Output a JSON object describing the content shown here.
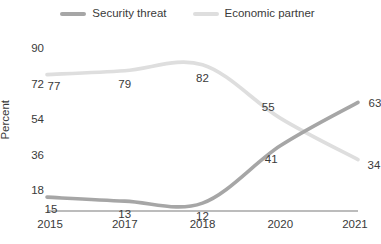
{
  "chart_data": {
    "type": "line",
    "title": "",
    "subtitle": "",
    "xlabel": "",
    "ylabel": "Percent",
    "categories": [
      "2015",
      "2017",
      "2018",
      "2020",
      "2021"
    ],
    "yticks": [
      90,
      72,
      54,
      36,
      18
    ],
    "ylim": [
      8,
      92
    ],
    "grid": false,
    "legend_position": "top-center",
    "smooth": true,
    "series": [
      {
        "name": "Security threat",
        "color": "#a6a6a6",
        "values": [
          15,
          13,
          12,
          41,
          63
        ],
        "labels": [
          "15",
          "13",
          "12",
          "41",
          "63"
        ]
      },
      {
        "name": "Economic partner",
        "color": "#dedede",
        "values": [
          77,
          79,
          82,
          55,
          34
        ],
        "labels": [
          "77",
          "79",
          "82",
          "55",
          "34"
        ]
      }
    ]
  },
  "legend": {
    "items": [
      {
        "label": "Security threat",
        "color": "#a6a6a6"
      },
      {
        "label": "Economic partner",
        "color": "#dedede"
      }
    ]
  },
  "axes": {
    "y_title": "Percent",
    "y_tick_labels": [
      "90",
      "72",
      "54",
      "36",
      "18"
    ],
    "x_tick_labels": [
      "2015",
      "2017",
      "2018",
      "2020",
      "2021"
    ],
    "axis_line_color": "#7a7a7a"
  },
  "data_labels": {
    "security_threat": [
      "15",
      "13",
      "12",
      "41",
      "63"
    ],
    "economic_partner": [
      "77",
      "79",
      "82",
      "55",
      "34"
    ]
  }
}
